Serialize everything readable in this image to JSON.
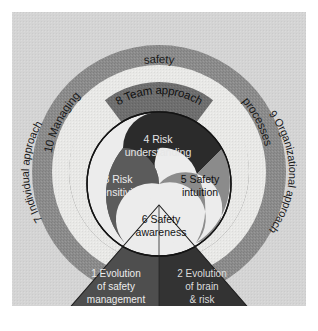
{
  "figure": {
    "background_color": "#ffffff",
    "panel_color": "#d4d4d4"
  },
  "rings": {
    "outer": {
      "label_left": "10 Managing",
      "label_top": "safety",
      "label_right": "processes",
      "full_label": "10 Managing safety processes",
      "color": "#8c8c8c",
      "text_color": "#1a1a1a"
    },
    "light_band": {
      "label_left": "7 Individual approach",
      "label_right": "9 Organizational approach",
      "color": "#e8e8e6",
      "text_color": "#1a1a1a"
    },
    "team_arc": {
      "label": "8 Team approach",
      "color": "#6e6e6e",
      "text_color": "#111111"
    }
  },
  "core": {
    "lobes": [
      {
        "id": "risk-understanding",
        "number": "4",
        "line1": "4 Risk",
        "line2": "understanding",
        "color": "#2b2b2b",
        "text_color": "#e6e6e6"
      },
      {
        "id": "risk-sensitivity",
        "number": "3",
        "line1": "3 Risk",
        "line2": "sensitivity",
        "color": "#5b5b5b",
        "text_color": "#ececec"
      },
      {
        "id": "safety-intuition",
        "number": "5",
        "line1": "5 Safety",
        "line2": "intuition",
        "color": "#8b8b8b",
        "text_color": "#101010"
      },
      {
        "id": "safety-awareness",
        "number": "6",
        "line1": "6 Safety",
        "line2": "awareness",
        "color": "#ececec",
        "text_color": "#141414"
      }
    ]
  },
  "base": {
    "left": {
      "id": "evolution-of-safety-management",
      "number": "1",
      "line1": "1 Evolution",
      "line2": "of safety",
      "line3": "management",
      "color": "#4e4e4e",
      "text_color": "#ededed"
    },
    "right": {
      "id": "evolution-of-brain-and-risk",
      "number": "2",
      "line1": "2 Evolution",
      "line2": "of brain",
      "line3": "& risk",
      "color": "#333333",
      "text_color": "#dcdcdc"
    }
  }
}
